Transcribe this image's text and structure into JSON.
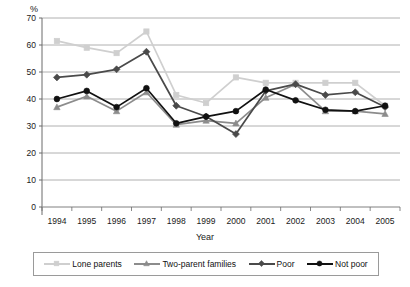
{
  "chart_data": {
    "type": "line",
    "title": "",
    "subtitle": "",
    "xlabel": "Year",
    "ylabel": "%",
    "unit_label": "%",
    "categories": [
      "1994",
      "1995",
      "1996",
      "1997",
      "1998",
      "1999",
      "2000",
      "2001",
      "2002",
      "2003",
      "2004",
      "2005"
    ],
    "x": [
      1994,
      1995,
      1996,
      1997,
      1998,
      1999,
      2000,
      2001,
      2002,
      2003,
      2004,
      2005
    ],
    "ylim": [
      0,
      70
    ],
    "ytick_step": 10,
    "yticks": [
      0,
      10,
      20,
      30,
      40,
      50,
      60,
      70
    ],
    "ytick_labels": [
      "0",
      "10",
      "20",
      "30",
      "40",
      "50",
      "60",
      "70"
    ],
    "grid": "horizontal",
    "legend_position": "bottom",
    "series": [
      {
        "name": "Lone parents",
        "color": "#cfcfcf",
        "marker": "square",
        "values": [
          61.5,
          59.0,
          57.0,
          65.0,
          41.5,
          38.5,
          48.0,
          46.0,
          46.0,
          46.0,
          46.0,
          37.5
        ]
      },
      {
        "name": "Two-parent families",
        "color": "#8c8c8c",
        "marker": "triangle",
        "values": [
          37.0,
          41.0,
          35.5,
          42.5,
          30.5,
          32.0,
          31.0,
          40.5,
          45.5,
          35.5,
          35.5,
          34.5
        ]
      },
      {
        "name": "Poor",
        "color": "#4a4a4a",
        "marker": "diamond",
        "values": [
          48.0,
          49.0,
          51.0,
          57.5,
          37.5,
          33.5,
          27.0,
          43.0,
          45.5,
          41.5,
          42.5,
          37.0
        ]
      },
      {
        "name": "Not poor",
        "color": "#111111",
        "marker": "circle",
        "values": [
          40.0,
          43.0,
          37.0,
          44.0,
          31.0,
          33.5,
          35.5,
          43.5,
          39.5,
          36.0,
          35.5,
          37.5
        ]
      }
    ]
  },
  "legend": {
    "items": [
      {
        "label": "Lone parents"
      },
      {
        "label": "Two-parent families"
      },
      {
        "label": "Poor"
      },
      {
        "label": "Not poor"
      }
    ]
  }
}
